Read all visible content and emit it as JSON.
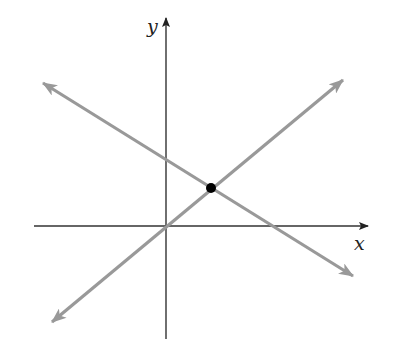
{
  "diagram": {
    "type": "coordinate-plane-two-lines",
    "axes": {
      "x_label": "x",
      "y_label": "y",
      "origin_px": [
        166,
        226
      ],
      "x_axis_px": {
        "from": [
          34,
          226
        ],
        "to": [
          368,
          226
        ]
      },
      "y_axis_px": {
        "from": [
          166,
          339
        ],
        "to": [
          166,
          18
        ]
      },
      "color": "#333333"
    },
    "lines": [
      {
        "name": "increasing-line-through-origin",
        "from_px": [
          52,
          322
        ],
        "to_px": [
          343,
          80
        ],
        "color": "#999999",
        "arrows": "both"
      },
      {
        "name": "decreasing-line",
        "from_px": [
          43,
          83
        ],
        "to_px": [
          353,
          276
        ],
        "color": "#999999",
        "arrows": "both"
      }
    ],
    "intersection_point": {
      "px": [
        211,
        188
      ],
      "color": "#000000",
      "radius": 5
    }
  }
}
